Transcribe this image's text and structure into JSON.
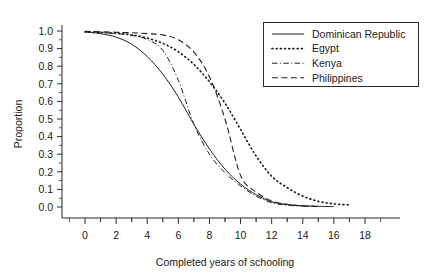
{
  "chart_data": {
    "type": "line",
    "title": "",
    "subtitle": "",
    "xlabel": "Completed years of schooling",
    "ylabel": "Proportion",
    "xlim": [
      -1,
      19
    ],
    "ylim": [
      0.0,
      1.0
    ],
    "xticks": [
      0,
      2,
      4,
      6,
      8,
      10,
      12,
      14,
      16,
      18
    ],
    "xticklabels": [
      "0",
      "2",
      "4",
      "6",
      "8",
      "10",
      "12",
      "14",
      "16",
      "18"
    ],
    "yticks": [
      0.0,
      0.1,
      0.2,
      0.3,
      0.4,
      0.5,
      0.6,
      0.7,
      0.8,
      0.9,
      1.0
    ],
    "yticklabels": [
      "0.0",
      "0.1",
      "0.2",
      "0.3",
      "0.4",
      "0.5",
      "0.6",
      "0.7",
      "0.8",
      "0.9",
      "1.0"
    ],
    "grid": false,
    "legend_position": "top-right",
    "minor_ticks": true,
    "x": [
      0,
      1,
      2,
      3,
      4,
      5,
      6,
      7,
      8,
      9,
      10,
      11,
      12,
      13,
      14,
      15,
      16,
      17,
      18
    ],
    "series": [
      {
        "name": "Dominican Republic",
        "style": "solid",
        "color": "#1f1f1f",
        "values": [
          0.995,
          0.985,
          0.965,
          0.925,
          0.855,
          0.755,
          0.625,
          0.47,
          0.33,
          0.215,
          0.13,
          0.07,
          0.03,
          0.014,
          0.007,
          0.004,
          0.002,
          null,
          null
        ]
      },
      {
        "name": "Egypt",
        "style": "dotted",
        "color": "#1f1f1f",
        "values": [
          0.995,
          0.992,
          0.988,
          0.978,
          0.96,
          0.93,
          0.882,
          0.81,
          0.712,
          0.59,
          0.44,
          0.29,
          0.175,
          0.11,
          0.062,
          0.032,
          0.018,
          0.012,
          null
        ]
      },
      {
        "name": "Kenya",
        "style": "dashdot",
        "color": "#1f1f1f",
        "values": [
          0.995,
          0.99,
          0.985,
          0.975,
          0.952,
          0.89,
          0.72,
          0.47,
          0.3,
          0.195,
          0.12,
          0.062,
          0.024,
          0.01,
          0.005,
          0.002,
          null,
          null,
          null
        ]
      },
      {
        "name": "Philippines",
        "style": "dashed",
        "color": "#1f1f1f",
        "values": [
          0.998,
          0.996,
          0.993,
          0.99,
          0.985,
          0.978,
          0.95,
          0.88,
          0.74,
          0.5,
          0.18,
          0.085,
          0.035,
          0.015,
          0.006,
          0.003,
          null,
          null,
          null
        ]
      }
    ],
    "legend_entries": [
      {
        "label": "Dominican Republic",
        "style": "solid"
      },
      {
        "label": "Egypt",
        "style": "dotted"
      },
      {
        "label": "Kenya",
        "style": "dashdot"
      },
      {
        "label": "Philippines",
        "style": "dashed"
      }
    ]
  }
}
